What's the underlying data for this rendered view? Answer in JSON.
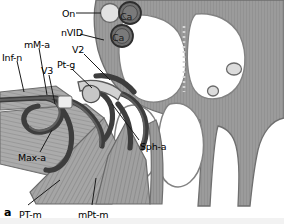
{
  "figure": {
    "panel_letter": "a",
    "type": "anatomical-cross-section",
    "region": "pterygopalatine fossa",
    "style": "grayscale line illustration"
  },
  "palette": {
    "bone_fill": "#9b9b9b",
    "bone_hatch": "#8a8a8a",
    "cavity_fill": "#ffffff",
    "cavity_outline": "#7d7d7d",
    "vessel_dark": "#4a4a4a",
    "vessel_outline": "#2f2f2f",
    "muscle_fill": "#a8a8a8",
    "muscle_stripe": "#7e7e7e",
    "artery_circle_dark": "#6e6e6e",
    "nerve_circle_light": "#d8d8d8",
    "label_text": "#000000",
    "leader_line": "#1a1a1a",
    "background": "#ffffff",
    "footer_band": "#f2f2f2"
  },
  "labels": [
    {
      "id": "on",
      "text": "On",
      "x": 62,
      "y": 9,
      "note": "optic nerve"
    },
    {
      "id": "ca1",
      "text": "Ca",
      "x": 120,
      "y": 12,
      "note": "carotid artery upper"
    },
    {
      "id": "ca2",
      "text": "Ca",
      "x": 112,
      "y": 33,
      "note": "carotid artery lower"
    },
    {
      "id": "nvid",
      "text": "nVID",
      "x": 61,
      "y": 28,
      "note": "vidian nerve"
    },
    {
      "id": "mma",
      "text": "mM-a",
      "x": 24,
      "y": 40,
      "note": "middle meningeal artery"
    },
    {
      "id": "v2",
      "text": "V2",
      "x": 72,
      "y": 45,
      "note": "maxillary nerve"
    },
    {
      "id": "infn",
      "text": "Inf-n",
      "x": 2,
      "y": 53,
      "note": "infraorbital nerve"
    },
    {
      "id": "v3",
      "text": "V3",
      "x": 41,
      "y": 66,
      "note": "mandibular nerve"
    },
    {
      "id": "ptg",
      "text": "Pt-g",
      "x": 57,
      "y": 60,
      "note": "pterygopalatine ganglion"
    },
    {
      "id": "maxa",
      "text": "Max-a",
      "x": 18,
      "y": 153,
      "note": "maxillary artery"
    },
    {
      "id": "spha",
      "text": "Sph-a",
      "x": 140,
      "y": 142,
      "note": "sphenopalatine artery"
    },
    {
      "id": "ptm",
      "text": "PT-m",
      "x": 19,
      "y": 210,
      "note": "pterygoid temporal muscle"
    },
    {
      "id": "mptm",
      "text": "mPt-m",
      "x": 78,
      "y": 210,
      "note": "medial pterygoid muscle"
    }
  ],
  "leaders": [
    {
      "id": "on-leader",
      "from": [
        76,
        13
      ],
      "to": [
        101,
        13
      ]
    },
    {
      "id": "nvid-leader",
      "from": [
        80,
        34
      ],
      "to": [
        104,
        40
      ]
    },
    {
      "id": "mma-leader",
      "from": [
        39,
        48
      ],
      "to": [
        47,
        95
      ]
    },
    {
      "id": "v2-leader",
      "from": [
        84,
        54
      ],
      "to": [
        110,
        80
      ]
    },
    {
      "id": "infn-leader",
      "from": [
        17,
        61
      ],
      "to": [
        24,
        92
      ]
    },
    {
      "id": "v3-leader",
      "from": [
        49,
        75
      ],
      "to": [
        55,
        104
      ]
    },
    {
      "id": "ptg-leader",
      "from": [
        72,
        69
      ],
      "to": [
        92,
        88
      ]
    },
    {
      "id": "maxa-leader",
      "from": [
        40,
        152
      ],
      "to": [
        52,
        130
      ]
    },
    {
      "id": "spha-leader",
      "from": [
        139,
        140
      ],
      "to": [
        112,
        104
      ]
    },
    {
      "id": "ptm-leader",
      "from": [
        28,
        205
      ],
      "to": [
        60,
        180
      ]
    },
    {
      "id": "mptm-leader",
      "from": [
        92,
        205
      ],
      "to": [
        96,
        178
      ]
    }
  ],
  "structures": [
    {
      "id": "skull-base-mass",
      "name": "sphenoid body and skull base bone"
    },
    {
      "id": "sphenoid-sinus-left",
      "name": "left sphenoid sinus cavity"
    },
    {
      "id": "sphenoid-sinus-right",
      "name": "right sphenoid sinus cavity"
    },
    {
      "id": "nasal-cavity",
      "name": "nasal cavity"
    },
    {
      "id": "carotid-upper",
      "name": "internal carotid artery upper"
    },
    {
      "id": "carotid-lower",
      "name": "internal carotid artery lower"
    },
    {
      "id": "optic-canal",
      "name": "optic canal"
    },
    {
      "id": "foramen-small-upper",
      "name": "small foramen upper right"
    },
    {
      "id": "foramen-small-lower",
      "name": "small foramen lower right"
    },
    {
      "id": "temporalis-muscle",
      "name": "temporalis muscle striations"
    },
    {
      "id": "lateral-pterygoid",
      "name": "lateral pterygoid muscle"
    },
    {
      "id": "medial-pterygoid",
      "name": "medial pterygoid muscle"
    },
    {
      "id": "pterygoid-plates",
      "name": "pterygoid plates"
    },
    {
      "id": "maxillary-artery",
      "name": "maxillary artery loop"
    },
    {
      "id": "vessel-network",
      "name": "pterygopalatine vascular network"
    }
  ]
}
